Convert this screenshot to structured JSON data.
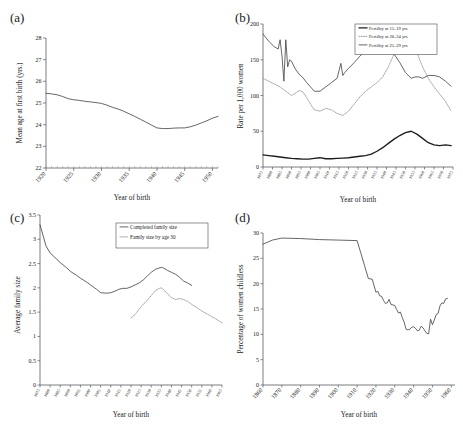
{
  "figure": {
    "panels": [
      {
        "id": "a",
        "label": "(a)",
        "xlabel": "Year of birth",
        "ylabel": "Mean age at first birth (yrs.)"
      },
      {
        "id": "b",
        "label": "(b)",
        "xlabel": "Year of birth",
        "ylabel": "Rate per 1,000 women"
      },
      {
        "id": "c",
        "label": "(c)",
        "xlabel": "Year of birth",
        "ylabel": "Average family size"
      },
      {
        "id": "d",
        "label": "(d)",
        "xlabel": "Year of birth",
        "ylabel": "Percentage of women childless"
      }
    ]
  },
  "chart_data": [
    {
      "panel": "a",
      "type": "line",
      "title": "(a)",
      "xlabel": "Year of birth",
      "ylabel": "Mean age at first birth (yrs.)",
      "xlim": [
        1920,
        1951
      ],
      "ylim": [
        22,
        28
      ],
      "xticks": [
        1920,
        1925,
        1930,
        1935,
        1940,
        1945,
        1950
      ],
      "yticks": [
        22,
        23,
        24,
        25,
        26,
        27,
        28
      ],
      "grid": false,
      "legend": "none",
      "series": [
        {
          "name": "Mean age at first birth",
          "style": "solid",
          "color": "#4a4a4a",
          "x": [
            1920,
            1921,
            1922,
            1923,
            1924,
            1925,
            1926,
            1927,
            1928,
            1929,
            1930,
            1931,
            1932,
            1933,
            1934,
            1935,
            1936,
            1937,
            1938,
            1939,
            1940,
            1941,
            1942,
            1943,
            1944,
            1945,
            1946,
            1947,
            1948,
            1949,
            1950,
            1951
          ],
          "values": [
            25.45,
            25.42,
            25.38,
            25.3,
            25.2,
            25.15,
            25.12,
            25.08,
            25.05,
            25.02,
            24.98,
            24.9,
            24.8,
            24.72,
            24.62,
            24.5,
            24.38,
            24.25,
            24.12,
            23.98,
            23.85,
            23.82,
            23.82,
            23.84,
            23.85,
            23.85,
            23.9,
            23.98,
            24.08,
            24.18,
            24.3,
            24.38
          ]
        }
      ]
    },
    {
      "panel": "b",
      "type": "line",
      "title": "(b)",
      "xlabel": "Year of birth",
      "ylabel": "Rate per 1,000 women",
      "xlim": [
        1875,
        1975
      ],
      "ylim": [
        0,
        200
      ],
      "xticks": [
        1875,
        1880,
        1885,
        1890,
        1895,
        1900,
        1905,
        1910,
        1915,
        1920,
        1925,
        1930,
        1935,
        1940,
        1945,
        1950,
        1955,
        1960,
        1965,
        1970,
        1975
      ],
      "yticks": [
        0,
        50,
        100,
        150,
        200
      ],
      "grid": false,
      "legend": "upper-right",
      "series": [
        {
          "name": "Fertility at 15–19 yrs",
          "style": "thick-solid",
          "color": "#1d1d1d",
          "x": [
            1875,
            1878,
            1881,
            1884,
            1887,
            1890,
            1893,
            1896,
            1899,
            1902,
            1905,
            1908,
            1911,
            1914,
            1917,
            1920,
            1923,
            1926,
            1929,
            1932,
            1935,
            1938,
            1941,
            1944,
            1947,
            1950,
            1953,
            1956,
            1959,
            1962,
            1965,
            1968,
            1971,
            1974
          ],
          "values": [
            17,
            16,
            15,
            14,
            13,
            12,
            11.5,
            11,
            11,
            12,
            13,
            11.5,
            11.5,
            12,
            12.5,
            13,
            14,
            15,
            16,
            18,
            22,
            27,
            33,
            39,
            44,
            48,
            50,
            46,
            40,
            34,
            31,
            30,
            31,
            30
          ]
        },
        {
          "name": "Fertility at 20–24 yrs",
          "style": "dotted",
          "color": "#9a9a9a",
          "x": [
            1875,
            1878,
            1881,
            1884,
            1886,
            1888,
            1890,
            1892,
            1894,
            1896,
            1898,
            1900,
            1902,
            1905,
            1908,
            1911,
            1914,
            1917,
            1920,
            1923,
            1926,
            1929,
            1932,
            1935,
            1938,
            1941,
            1944,
            1947,
            1950,
            1953,
            1956,
            1959,
            1962,
            1965,
            1968,
            1971,
            1974
          ],
          "values": [
            124,
            120,
            116,
            112,
            108,
            104,
            100,
            103,
            107,
            105,
            97,
            88,
            80,
            78,
            82,
            80,
            75,
            72,
            78,
            88,
            98,
            106,
            112,
            118,
            126,
            140,
            158,
            172,
            185,
            178,
            160,
            140,
            124,
            112,
            102,
            92,
            78
          ]
        },
        {
          "name": "Fertility at 25–29 yrs",
          "style": "solid",
          "color": "#4a4a4a",
          "x": [
            1875,
            1878,
            1881,
            1883,
            1884,
            1885,
            1886,
            1887,
            1888,
            1889,
            1890,
            1892,
            1894,
            1896,
            1898,
            1900,
            1902,
            1905,
            1908,
            1911,
            1914,
            1916,
            1917,
            1918,
            1920,
            1923,
            1926,
            1929,
            1932,
            1935,
            1938,
            1941,
            1944,
            1947,
            1950,
            1953,
            1955,
            1957,
            1959,
            1962,
            1965,
            1968,
            1971,
            1974
          ],
          "values": [
            186,
            176,
            168,
            165,
            178,
            155,
            120,
            178,
            140,
            150,
            148,
            137,
            130,
            125,
            118,
            112,
            106,
            106,
            112,
            118,
            124,
            145,
            128,
            132,
            138,
            146,
            155,
            163,
            172,
            180,
            176,
            168,
            158,
            146,
            132,
            124,
            126,
            126,
            124,
            128,
            128,
            126,
            120,
            113
          ]
        }
      ]
    },
    {
      "panel": "c",
      "type": "line",
      "title": "(c)",
      "xlabel": "Year of birth",
      "ylabel": "Average family size",
      "xlim": [
        1875,
        1965
      ],
      "ylim": [
        0,
        3.5
      ],
      "xticks": [
        1875,
        1880,
        1885,
        1890,
        1895,
        1900,
        1905,
        1910,
        1915,
        1920,
        1925,
        1930,
        1935,
        1940,
        1945,
        1950,
        1955,
        1960,
        1965
      ],
      "yticks": [
        0,
        0.5,
        1,
        1.5,
        2,
        2.5,
        3,
        3.5
      ],
      "grid": false,
      "legend": "upper-right",
      "series": [
        {
          "name": "Completed family size",
          "style": "solid",
          "color": "#4a4a4a",
          "x": [
            1875,
            1878,
            1880,
            1883,
            1885,
            1888,
            1890,
            1893,
            1895,
            1898,
            1900,
            1903,
            1905,
            1908,
            1910,
            1912,
            1914,
            1916,
            1918,
            1920,
            1922,
            1924,
            1926,
            1928,
            1930,
            1932,
            1934,
            1935,
            1936,
            1938,
            1940,
            1942,
            1944,
            1946,
            1948,
            1950
          ],
          "values": [
            3.3,
            2.86,
            2.72,
            2.6,
            2.52,
            2.42,
            2.34,
            2.26,
            2.2,
            2.12,
            2.06,
            1.97,
            1.9,
            1.89,
            1.9,
            1.93,
            1.97,
            1.99,
            1.99,
            2.02,
            2.06,
            2.1,
            2.16,
            2.24,
            2.32,
            2.38,
            2.41,
            2.42,
            2.41,
            2.36,
            2.32,
            2.28,
            2.22,
            2.14,
            2.1,
            2.05
          ]
        },
        {
          "name": "Family size by age 30",
          "style": "dotted",
          "color": "#9a9a9a",
          "x": [
            1920,
            1922,
            1924,
            1926,
            1928,
            1930,
            1932,
            1934,
            1935,
            1936,
            1938,
            1940,
            1942,
            1944,
            1946,
            1948,
            1950,
            1953,
            1956,
            1959,
            1962,
            1965
          ],
          "values": [
            1.38,
            1.45,
            1.56,
            1.66,
            1.74,
            1.84,
            1.94,
            1.99,
            2.0,
            1.97,
            1.88,
            1.8,
            1.76,
            1.78,
            1.76,
            1.72,
            1.66,
            1.58,
            1.5,
            1.43,
            1.36,
            1.28
          ]
        }
      ]
    },
    {
      "panel": "d",
      "type": "line",
      "title": "(d)",
      "xlabel": "Year of birth",
      "ylabel": "Percentage of women childless",
      "xlim": [
        1860,
        1962
      ],
      "ylim": [
        0,
        30
      ],
      "xticks": [
        1860,
        1870,
        1880,
        1890,
        1900,
        1910,
        1920,
        1930,
        1940,
        1950,
        1960
      ],
      "yticks": [
        0,
        5,
        10,
        15,
        20,
        25,
        30
      ],
      "grid": false,
      "legend": "none",
      "series": [
        {
          "name": "Percentage of women childless",
          "style": "solid",
          "color": "#4a4a4a",
          "x": [
            1860,
            1865,
            1870,
            1880,
            1890,
            1900,
            1910,
            1912,
            1914,
            1916,
            1918,
            1920,
            1921,
            1922,
            1923,
            1924,
            1925,
            1926,
            1927,
            1928,
            1929,
            1930,
            1931,
            1932,
            1933,
            1934,
            1935,
            1936,
            1937,
            1938,
            1939,
            1940,
            1941,
            1942,
            1943,
            1944,
            1945,
            1946,
            1947,
            1948,
            1949,
            1950,
            1951,
            1952,
            1953,
            1954,
            1955,
            1956,
            1957,
            1958
          ],
          "values": [
            27.8,
            28.6,
            29.0,
            28.9,
            28.7,
            28.6,
            28.5,
            26.0,
            23.5,
            21.0,
            20.9,
            18.3,
            18.5,
            17.6,
            17.5,
            16.7,
            16.1,
            16.2,
            16.9,
            15.9,
            15.8,
            15.7,
            14.9,
            14.2,
            14.4,
            13.3,
            12.4,
            11.0,
            10.9,
            11.0,
            11.4,
            11.5,
            11.2,
            10.7,
            10.8,
            11.6,
            11.3,
            10.7,
            10.2,
            10.1,
            13.0,
            11.9,
            12.8,
            13.9,
            14.1,
            15.6,
            16.2,
            16.1,
            17.0,
            17.1
          ]
        }
      ]
    }
  ]
}
